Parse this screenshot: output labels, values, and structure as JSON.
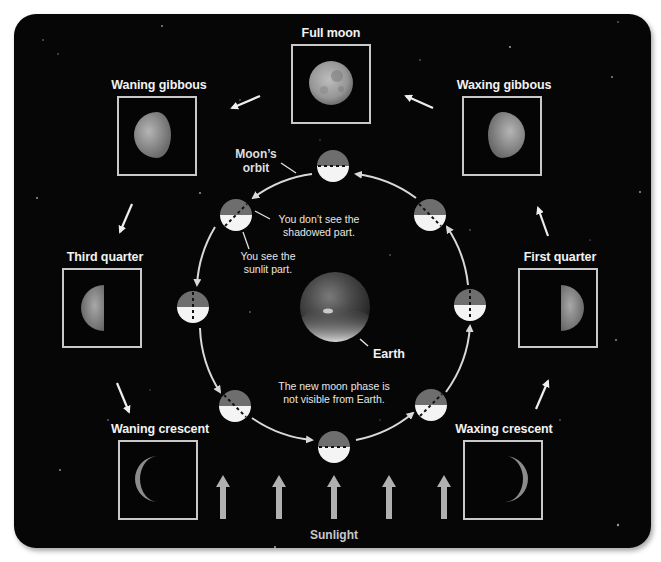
{
  "phases": [
    {
      "id": "full-moon",
      "label": "Full moon"
    },
    {
      "id": "waning-gibbous",
      "label": "Waning gibbous"
    },
    {
      "id": "waxing-gibbous",
      "label": "Waxing gibbous"
    },
    {
      "id": "third-quarter",
      "label": "Third quarter"
    },
    {
      "id": "first-quarter",
      "label": "First quarter"
    },
    {
      "id": "waning-crescent",
      "label": "Waning crescent"
    },
    {
      "id": "waxing-crescent",
      "label": "Waxing crescent"
    }
  ],
  "annotations": {
    "orbit": "Moon's\norbit",
    "orbit_line1": "Moon’s",
    "orbit_line2": "orbit",
    "shadow_line1": "You don’t see the",
    "shadow_line2": "shadowed part.",
    "sunlit_line1": "You see the",
    "sunlit_line2": "sunlit part.",
    "newmoon_line1": "The new moon phase is",
    "newmoon_line2": "not visible from Earth.",
    "earth": "Earth",
    "sunlight": "Sunlight"
  },
  "colors": {
    "background": "#060606",
    "frame": "#c9c9c9",
    "label": "#f2f2f2",
    "orbit": "#d9d9d9",
    "moon_lit": "#f4f4f4",
    "moon_dark": "#6e6e6e",
    "sun_arrow": "#b0b0b0"
  },
  "sunlight_arrow_count": 5,
  "orbit_moon_count": 8
}
